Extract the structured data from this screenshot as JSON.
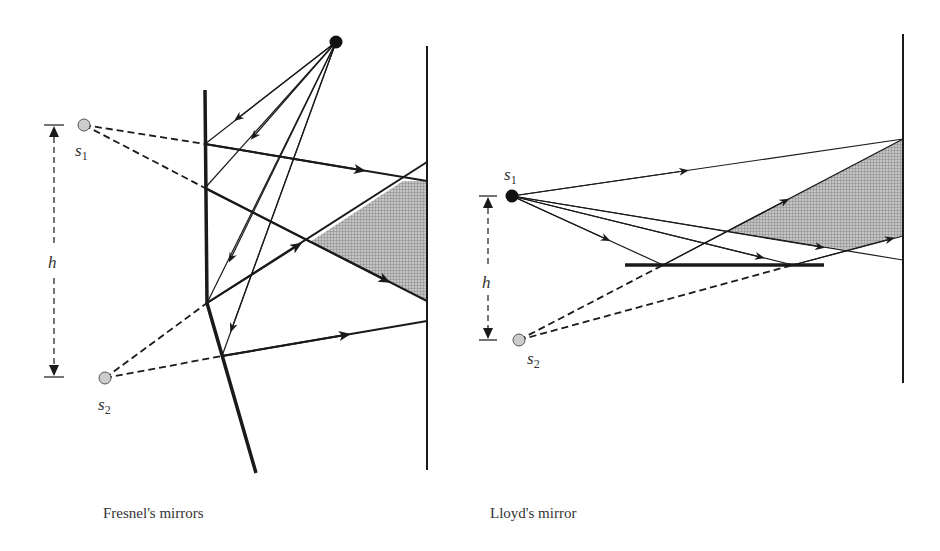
{
  "figure": {
    "left_panel": {
      "caption": "Fresnel's mirrors",
      "labels": {
        "source1": "s",
        "source1_sub": "1",
        "source2": "s",
        "source2_sub": "2",
        "height": "h"
      }
    },
    "right_panel": {
      "caption": "Lloyd's mirror",
      "labels": {
        "source1": "s",
        "source1_sub": "1",
        "source2": "s",
        "source2_sub": "2",
        "height": "h"
      }
    },
    "colors": {
      "line": "#1a1a1a",
      "virtual_source_fill": "#cccccc",
      "real_source_fill": "#111111",
      "interference_fill": "#b0b0b0",
      "text": "#333333"
    }
  }
}
